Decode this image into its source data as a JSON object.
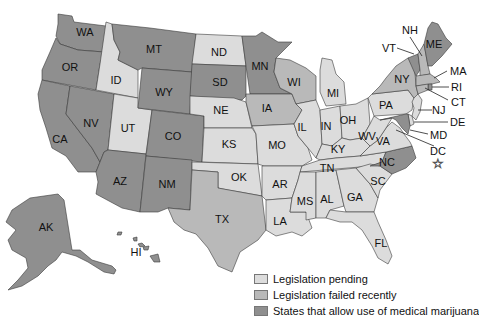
{
  "colors": {
    "pending": "#dcdcdc",
    "failed": "#b9b9b9",
    "allowed": "#8f8f8f",
    "stroke": "#3a3a3a"
  },
  "legend": [
    {
      "key": "pending",
      "label": "Legislation pending"
    },
    {
      "key": "failed",
      "label": "Legislation failed recently"
    },
    {
      "key": "allowed",
      "label": "States that allow use of medical marijuana"
    }
  ],
  "states": {
    "WA": {
      "label": "WA",
      "status": "allowed"
    },
    "OR": {
      "label": "OR",
      "status": "allowed"
    },
    "CA": {
      "label": "CA",
      "status": "allowed"
    },
    "NV": {
      "label": "NV",
      "status": "allowed"
    },
    "ID": {
      "label": "ID",
      "status": "pending"
    },
    "UT": {
      "label": "UT",
      "status": "pending"
    },
    "AZ": {
      "label": "AZ",
      "status": "allowed"
    },
    "MT": {
      "label": "MT",
      "status": "allowed"
    },
    "WY": {
      "label": "WY",
      "status": "allowed"
    },
    "CO": {
      "label": "CO",
      "status": "allowed"
    },
    "NM": {
      "label": "NM",
      "status": "allowed"
    },
    "ND": {
      "label": "ND",
      "status": "pending"
    },
    "SD": {
      "label": "SD",
      "status": "allowed"
    },
    "NE": {
      "label": "NE",
      "status": "pending"
    },
    "KS": {
      "label": "KS",
      "status": "pending"
    },
    "OK": {
      "label": "OK",
      "status": "pending"
    },
    "TX": {
      "label": "TX",
      "status": "failed"
    },
    "MN": {
      "label": "MN",
      "status": "allowed"
    },
    "IA": {
      "label": "IA",
      "status": "failed"
    },
    "MO": {
      "label": "MO",
      "status": "pending"
    },
    "AR": {
      "label": "AR",
      "status": "pending"
    },
    "LA": {
      "label": "LA",
      "status": "pending"
    },
    "WI": {
      "label": "WI",
      "status": "failed"
    },
    "IL": {
      "label": "IL",
      "status": "pending"
    },
    "MI": {
      "label": "MI",
      "status": "pending"
    },
    "IN": {
      "label": "IN",
      "status": "pending"
    },
    "OH": {
      "label": "OH",
      "status": "pending"
    },
    "KY": {
      "label": "KY",
      "status": "pending"
    },
    "TN": {
      "label": "TN",
      "status": "pending"
    },
    "MS": {
      "label": "MS",
      "status": "pending"
    },
    "AL": {
      "label": "AL",
      "status": "pending"
    },
    "GA": {
      "label": "GA",
      "status": "pending"
    },
    "FL": {
      "label": "FL",
      "status": "pending"
    },
    "SC": {
      "label": "SC",
      "status": "pending"
    },
    "NC": {
      "label": "NC",
      "status": "allowed"
    },
    "VA": {
      "label": "VA",
      "status": "pending"
    },
    "WV": {
      "label": "WV",
      "status": "pending"
    },
    "PA": {
      "label": "PA",
      "status": "pending"
    },
    "NY": {
      "label": "NY",
      "status": "failed"
    },
    "VT": {
      "label": "VT",
      "status": "allowed"
    },
    "NH": {
      "label": "NH",
      "status": "failed"
    },
    "ME": {
      "label": "ME",
      "status": "allowed"
    },
    "MA": {
      "label": "MA",
      "status": "failed"
    },
    "RI": {
      "label": "RI",
      "status": "allowed"
    },
    "CT": {
      "label": "CT",
      "status": "failed"
    },
    "NJ": {
      "label": "NJ",
      "status": "pending"
    },
    "DE": {
      "label": "DE",
      "status": "pending"
    },
    "MD": {
      "label": "MD",
      "status": "allowed"
    },
    "DC": {
      "label": "DC",
      "status": "allowed"
    },
    "AK": {
      "label": "AK",
      "status": "allowed"
    },
    "HI": {
      "label": "HI",
      "status": "allowed"
    }
  }
}
